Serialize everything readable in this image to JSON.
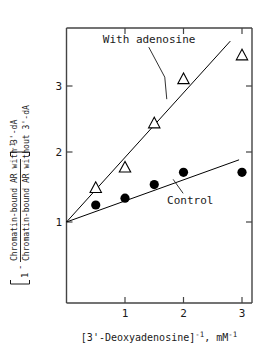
{
  "chart_data": {
    "type": "scatter",
    "title": "",
    "xlabel": "[3'-Deoxyadenosine]⁻¹, mM⁻¹",
    "ylabel": "[1 - (Chromatin-bound AR with 3'-dA) / (Chromatin-bound AR without 3'-dA)]⁻¹",
    "xlim": [
      0,
      3.17
    ],
    "ylim": [
      0.58,
      4.04
    ],
    "xticks": [
      1,
      2,
      3
    ],
    "xtick_labels": [
      "1",
      "2",
      "3"
    ],
    "yticks": [
      1,
      2,
      3
    ],
    "ytick_labels": [
      "1",
      "2",
      "3"
    ],
    "grid": false,
    "legend_position": "inline-annotation",
    "series": [
      {
        "name": "With adenosine",
        "marker": "open-triangle",
        "color": "#000000",
        "x": [
          0.5,
          1.0,
          1.5,
          2.0,
          3.0
        ],
        "y": [
          1.5,
          1.8,
          2.45,
          3.1,
          3.45
        ],
        "fit_line": {
          "intercept": 1.0,
          "slope": 0.95,
          "x_start": 0.0,
          "x_end": 2.8
        }
      },
      {
        "name": "Control",
        "marker": "filled-circle",
        "color": "#000000",
        "x": [
          0.5,
          1.0,
          1.5,
          2.0,
          3.0
        ],
        "y": [
          1.25,
          1.35,
          1.55,
          1.73,
          1.73
        ],
        "fit_line": {
          "intercept": 1.0,
          "slope": 0.31,
          "x_start": 0.0,
          "x_end": 2.95
        }
      }
    ],
    "annotations": [
      {
        "name": "with-adenosine-label",
        "text": "With adenosine",
        "x": 0.62,
        "y": 3.63
      },
      {
        "name": "control-label",
        "text": "Control",
        "x": 1.72,
        "y": 1.26
      }
    ]
  },
  "ylabel_parts": {
    "bracket_open": "[",
    "sub_one": "1",
    "minus": "-",
    "numerator": "Chromatin-bound AR with 3'-dA",
    "denominator": "Chromatin-bound AR without 3'-dA",
    "bracket_close": "]",
    "exponent": "-1"
  },
  "xlabel_parts": {
    "main": "[3'-Deoxyadenosine]",
    "exp1": "-1",
    "comma": ", mM",
    "exp2": "-1"
  },
  "axis_labels": {
    "x_tick_1": "1",
    "x_tick_2": "2",
    "x_tick_3": "3",
    "y_tick_1": "1",
    "y_tick_2": "2",
    "y_tick_3": "3"
  },
  "series_labels": {
    "with_adenosine": "With adenosine",
    "control": "Control"
  }
}
